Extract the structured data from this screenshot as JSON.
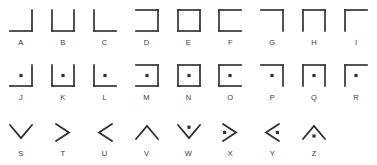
{
  "chart": {
    "stroke_color": "#333333",
    "background_color": "#ffffff",
    "label_color": "#3a3a3a",
    "rows": [
      {
        "name": "grid-plain",
        "cells": [
          {
            "label": "A",
            "shape": "grid",
            "sides": "bottom-right",
            "dot": false
          },
          {
            "label": "B",
            "shape": "grid",
            "sides": "left-bottom-right",
            "dot": false
          },
          {
            "label": "C",
            "shape": "grid",
            "sides": "left-bottom",
            "dot": false
          },
          {
            "label": "D",
            "shape": "grid",
            "sides": "top-right-bottom",
            "dot": false
          },
          {
            "label": "E",
            "shape": "grid",
            "sides": "all",
            "dot": false
          },
          {
            "label": "F",
            "shape": "grid",
            "sides": "top-left-bottom",
            "dot": false
          },
          {
            "label": "G",
            "shape": "grid",
            "sides": "top-right",
            "dot": false
          },
          {
            "label": "H",
            "shape": "grid",
            "sides": "top-left-right",
            "dot": false
          },
          {
            "label": "I",
            "shape": "grid",
            "sides": "top-left",
            "dot": false
          }
        ]
      },
      {
        "name": "grid-dotted",
        "cells": [
          {
            "label": "J",
            "shape": "grid",
            "sides": "bottom-right",
            "dot": true
          },
          {
            "label": "K",
            "shape": "grid",
            "sides": "left-bottom-right",
            "dot": true
          },
          {
            "label": "L",
            "shape": "grid",
            "sides": "left-bottom",
            "dot": true
          },
          {
            "label": "M",
            "shape": "grid",
            "sides": "top-right-bottom",
            "dot": true
          },
          {
            "label": "N",
            "shape": "grid",
            "sides": "all",
            "dot": true
          },
          {
            "label": "O",
            "shape": "grid",
            "sides": "top-left-bottom",
            "dot": true
          },
          {
            "label": "P",
            "shape": "grid",
            "sides": "top-right",
            "dot": true
          },
          {
            "label": "Q",
            "shape": "grid",
            "sides": "top-left-right",
            "dot": true
          },
          {
            "label": "R",
            "shape": "grid",
            "sides": "top-left",
            "dot": true
          }
        ]
      },
      {
        "name": "chevrons",
        "cells": [
          {
            "label": "S",
            "shape": "chevron",
            "direction": "down",
            "dot": false
          },
          {
            "label": "T",
            "shape": "chevron",
            "direction": "right",
            "dot": false
          },
          {
            "label": "U",
            "shape": "chevron",
            "direction": "left",
            "dot": false
          },
          {
            "label": "V",
            "shape": "chevron",
            "direction": "up",
            "dot": false
          },
          {
            "label": "W",
            "shape": "chevron",
            "direction": "down",
            "dot": true
          },
          {
            "label": "X",
            "shape": "chevron",
            "direction": "right",
            "dot": true
          },
          {
            "label": "Y",
            "shape": "chevron",
            "direction": "left",
            "dot": true
          },
          {
            "label": "Z",
            "shape": "chevron",
            "direction": "up",
            "dot": true
          },
          {
            "label": "",
            "shape": "empty",
            "direction": "",
            "dot": false
          }
        ]
      }
    ]
  }
}
